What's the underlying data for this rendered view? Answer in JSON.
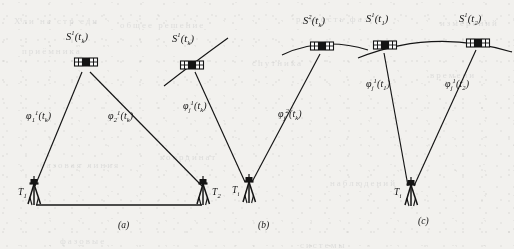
{
  "figure": {
    "background_color": "#f2f1ee",
    "ink_color": "#131313",
    "panels": [
      {
        "id": "a",
        "caption": "(a)",
        "satellites": [
          {
            "name": "satellite-s1-tk",
            "label_base": "S",
            "label_sup": "1",
            "label_arg": "(t",
            "label_sub": "k",
            "label_close": ")",
            "label_full": "S¹(tk)",
            "x": 85,
            "y": 53
          }
        ],
        "orbit_arc": false,
        "phase_labels": [
          {
            "name": "phi-1-1-tk",
            "base": "φ",
            "sub": "1",
            "sup": "1",
            "arg": "(t",
            "arg_sub": "k",
            "close": ")",
            "full": "φ₁¹(tk)",
            "x": 26,
            "y": 116
          },
          {
            "name": "phi-2-1-tk",
            "base": "φ",
            "sub": "2",
            "sup": "1",
            "arg": "(t",
            "arg_sub": "k",
            "close": ")",
            "full": "φ₂¹(tk)",
            "x": 108,
            "y": 116
          }
        ],
        "receivers": [
          {
            "name": "receiver-t1",
            "base": "T",
            "sub": "1",
            "full": "T1",
            "x": 30,
            "y": 192
          },
          {
            "name": "receiver-t2",
            "base": "T",
            "sub": "2",
            "full": "T2",
            "x": 207,
            "y": 192
          }
        ],
        "baseline": true
      },
      {
        "id": "b",
        "caption": "(b)",
        "satellites": [
          {
            "name": "satellite-s1-tk",
            "label_base": "S",
            "label_sup": "1",
            "label_arg": "(t",
            "label_sub": "k",
            "label_close": ")",
            "label_full": "S¹(tk)",
            "x": 190,
            "y": 53
          },
          {
            "name": "satellite-s2-tk",
            "label_base": "S",
            "label_sup": "2",
            "label_arg": "(t",
            "label_sub": "k",
            "label_close": ")",
            "label_full": "S²(tk)",
            "x": 318,
            "y": 27
          }
        ],
        "orbit_arc": true,
        "phase_labels": [
          {
            "name": "phi-j-1-tk",
            "base": "φ",
            "sub": "j",
            "sup": "1",
            "arg": "(t",
            "arg_sub": "k",
            "close": ")",
            "full": "φⱼ¹(tk)",
            "x": 186,
            "y": 105
          },
          {
            "name": "phi-j-2-tk",
            "base": "φ",
            "sub": "j",
            "sup": "2",
            "arg": "(t",
            "arg_sub": "k",
            "close": ")",
            "full": "φⱼ²(tk)",
            "x": 282,
            "y": 113
          }
        ],
        "receivers": [
          {
            "name": "receiver-ti",
            "base": "T",
            "sub": "i",
            "full": "Ti",
            "x": 236,
            "y": 184
          }
        ],
        "baseline": false
      },
      {
        "id": "c",
        "caption": "(c)",
        "satellites": [
          {
            "name": "satellite-s1-t1",
            "label_base": "S",
            "label_sup": "1",
            "label_arg": "(t",
            "label_sub": "1",
            "label_close": ")",
            "label_full": "S¹(t1)",
            "x": 378,
            "y": 24
          },
          {
            "name": "satellite-s1-t2",
            "label_base": "S",
            "label_sup": "1",
            "label_arg": "(t",
            "label_sub": "2",
            "label_close": ")",
            "label_full": "S¹(t2)",
            "x": 472,
            "y": 24
          }
        ],
        "orbit_arc": true,
        "phase_labels": [
          {
            "name": "phi-j-1-t1",
            "base": "φ",
            "sub": "j",
            "sup": "1",
            "arg": "(t",
            "arg_sub": "1",
            "close": ")",
            "full": "φⱼ¹(t1)",
            "x": 371,
            "y": 82
          },
          {
            "name": "phi-j-1-t2",
            "base": "φ",
            "sub": "j",
            "sup": "1",
            "arg": "(t",
            "arg_sub": "2",
            "close": ")",
            "full": "φⱼ¹(t2)",
            "x": 448,
            "y": 82
          }
        ],
        "receivers": [
          {
            "name": "receiver-ti",
            "base": "T",
            "sub": "i",
            "full": "Ti",
            "x": 398,
            "y": 186
          }
        ],
        "baseline": false
      }
    ],
    "captions": [
      {
        "name": "caption-a",
        "text": "(a)",
        "x": 118,
        "y": 226
      },
      {
        "name": "caption-b",
        "text": "(b)",
        "x": 258,
        "y": 226
      },
      {
        "name": "caption-c",
        "text": "(c)",
        "x": 418,
        "y": 222
      }
    ],
    "ghost_text": [
      {
        "text": "Хли на стр еди",
        "x": 14,
        "y": 16
      },
      {
        "text": "общее решение",
        "x": 120,
        "y": 20
      },
      {
        "text": "разность фаз",
        "x": 296,
        "y": 14
      },
      {
        "text": "измерений",
        "x": 440,
        "y": 18
      },
      {
        "text": "приёмника",
        "x": 22,
        "y": 46
      },
      {
        "text": "спутника",
        "x": 252,
        "y": 58
      },
      {
        "text": "времени",
        "x": 430,
        "y": 70
      },
      {
        "text": "координат",
        "x": 160,
        "y": 152
      },
      {
        "text": "базовая линия",
        "x": 40,
        "y": 160
      },
      {
        "text": "наблюдений",
        "x": 330,
        "y": 178
      },
      {
        "text": "фазовые",
        "x": 60,
        "y": 236
      },
      {
        "text": "системы",
        "x": 300,
        "y": 240
      }
    ]
  }
}
